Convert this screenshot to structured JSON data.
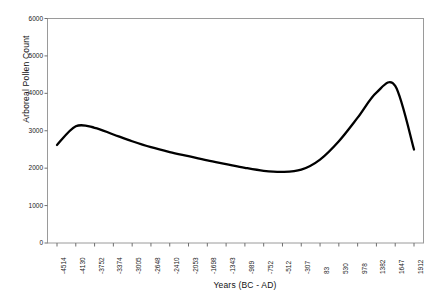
{
  "chart_data": {
    "type": "line",
    "title": "",
    "xlabel": "Years (BC - AD)",
    "ylabel": "Arboreal Pollen Count",
    "ylim": [
      0,
      6000
    ],
    "yticks": [
      0,
      1000,
      2000,
      3000,
      4000,
      5000,
      6000
    ],
    "ytick_labels": [
      "0",
      "1000",
      "2000",
      "3000",
      "4000",
      "5000",
      "6000"
    ],
    "grid": false,
    "legend": "none",
    "categories": [
      "-4514",
      "-4130",
      "-3752",
      "-3374",
      "-3005",
      "-2648",
      "-2410",
      "-2053",
      "-1698",
      "-1343",
      "-989",
      "-752",
      "-512",
      "-307",
      "83",
      "530",
      "978",
      "1382",
      "1647",
      "1912"
    ],
    "series": [
      {
        "name": "Arboreal Pollen Count",
        "color": "#000000",
        "values": [
          2620,
          3120,
          3080,
          2900,
          2720,
          2560,
          2430,
          2320,
          2210,
          2110,
          2010,
          1930,
          1900,
          1960,
          2230,
          2720,
          3350,
          4020,
          4200,
          2500
        ]
      }
    ]
  },
  "axes": {
    "y_axis_title": "Arboreal Pollen Count",
    "x_axis_title": "Years (BC - AD)"
  },
  "colors": {
    "line": "#000000",
    "frame": "#808080",
    "background": "#ffffff",
    "text": "#1a1a1a"
  }
}
